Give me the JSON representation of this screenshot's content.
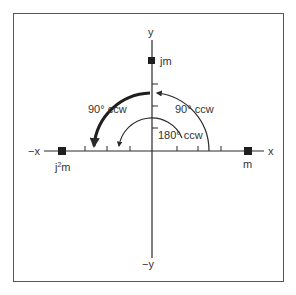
{
  "diagram": {
    "axes": {
      "x_pos_label": "x",
      "x_neg_label": "−x",
      "y_pos_label": "y",
      "y_neg_label": "−y"
    },
    "points": [
      {
        "id": "m",
        "label": "m",
        "position": "positive x-axis"
      },
      {
        "id": "jm",
        "label": "jm",
        "position": "positive y-axis"
      },
      {
        "id": "j2m",
        "label_base": "j",
        "label_sup": "2",
        "label_tail": "m",
        "position": "negative x-axis"
      }
    ],
    "rotations": [
      {
        "id": "rot-90-right",
        "label": "90° ccw",
        "from": "m",
        "to": "jm"
      },
      {
        "id": "rot-90-left",
        "label": "90° ccw",
        "from": "jm",
        "to": "j2m"
      },
      {
        "id": "rot-180",
        "label": "180° ccw",
        "from": "m",
        "to": "j2m"
      }
    ],
    "colors": {
      "ink": "#2a2a2a",
      "frame": "#555555",
      "background": "#ffffff"
    }
  }
}
